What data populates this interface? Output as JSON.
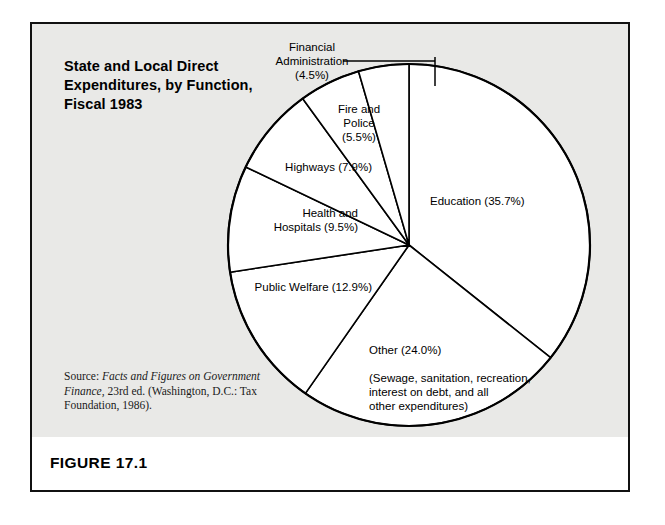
{
  "figure": {
    "number_label": "FIGURE 17.1",
    "title": "State and Local Direct Expenditures, by Function, Fiscal 1983",
    "source": {
      "prefix": "Source: ",
      "italic_part": "Facts and Figures on Government Finance,",
      "rest": " 23rd ed. (Washington, D.C.: Tax Foundation, 1986)."
    }
  },
  "chart_data": {
    "type": "pie",
    "title": "State and Local Direct Expenditures, by Function, Fiscal 1983",
    "xlabel": "",
    "ylabel": "",
    "legend_position": "none",
    "grid": false,
    "units": "percent",
    "total": 100.0,
    "categories": [
      "Education",
      "Other",
      "Public Welfare",
      "Health and Hospitals",
      "Highways",
      "Fire and Police",
      "Financial Administration"
    ],
    "values": [
      35.7,
      24.0,
      12.9,
      9.5,
      7.9,
      5.5,
      4.5
    ],
    "slices": [
      {
        "name": "Education",
        "value": 35.7,
        "label": "Education (35.7%)",
        "label_placement": "inside-right"
      },
      {
        "name": "Other",
        "value": 24.0,
        "label": "Other (24.0%)",
        "sublabel": "(Sewage, sanitation, recreation,\ninterest on debt, and all\nother expenditures)",
        "label_placement": "inside-bottom"
      },
      {
        "name": "Public Welfare",
        "value": 12.9,
        "label": "Public Welfare (12.9%)",
        "label_placement": "inside-left"
      },
      {
        "name": "Health and Hospitals",
        "value": 9.5,
        "label": "Health and\nHospitals (9.5%)",
        "label_placement": "inside-left"
      },
      {
        "name": "Highways",
        "value": 7.9,
        "label": "Highways (7.9%)",
        "label_placement": "inside-left"
      },
      {
        "name": "Fire and Police",
        "value": 5.5,
        "label": "Fire and\nPolice\n(5.5%)",
        "label_placement": "inside-top"
      },
      {
        "name": "Financial Administration",
        "value": 4.5,
        "label": "Financial\nAdministration\n(4.5%)",
        "label_placement": "outside-top-left",
        "has_leader_line": true
      }
    ],
    "colors": {
      "slice_fill": "#ffffff",
      "slice_stroke": "#000000",
      "panel_background": "#e9e9e7",
      "frame": "#111111"
    }
  }
}
